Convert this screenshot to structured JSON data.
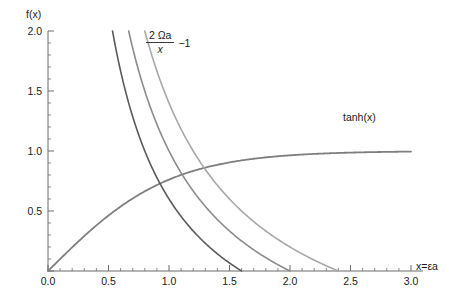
{
  "figure": {
    "background": "#ffffff",
    "axis_color": "#6b6b6b"
  },
  "axes": {
    "y_axis_title": "f(x)",
    "x_axis_title": "x=εa",
    "x_ticks": [
      "0.0",
      "0.5",
      "1.0",
      "1.5",
      "2.0",
      "2.5",
      "3.0"
    ],
    "y_ticks": [
      "0.5",
      "1.0",
      "1.5",
      "2.0"
    ]
  },
  "annotations": {
    "tanh_label": "tanh(x)",
    "formula_numerator": "2 Ωa",
    "formula_denominator": "x",
    "formula_tail": "−1"
  },
  "chart_data": {
    "type": "line",
    "title": "",
    "xlabel": "x=εa",
    "ylabel": "f(x)",
    "xlim": [
      0.0,
      3.0
    ],
    "ylim": [
      0.0,
      2.0
    ],
    "grid": false,
    "legend": "inline-annotations",
    "x_major_ticks": [
      0.0,
      0.5,
      1.0,
      1.5,
      2.0,
      2.5,
      3.0
    ],
    "y_major_ticks": [
      0.0,
      0.5,
      1.0,
      1.5,
      2.0
    ],
    "x_minor_tick_step": 0.1,
    "y_minor_tick_step": 0.1,
    "series": [
      {
        "name": "tanh(x)",
        "color": "#7f7f7f",
        "linewidth": 1.8,
        "formula": "tanh(x)",
        "x": [
          0.0,
          0.1,
          0.2,
          0.3,
          0.4,
          0.5,
          0.6,
          0.7,
          0.8,
          0.9,
          1.0,
          1.1,
          1.2,
          1.3,
          1.4,
          1.5,
          1.6,
          1.7,
          1.8,
          1.9,
          2.0,
          2.1,
          2.2,
          2.3,
          2.4,
          2.5,
          2.6,
          2.7,
          2.8,
          2.9,
          3.0
        ],
        "y": [
          0.0,
          0.1,
          0.197,
          0.291,
          0.38,
          0.462,
          0.537,
          0.604,
          0.664,
          0.716,
          0.762,
          0.8,
          0.834,
          0.862,
          0.885,
          0.905,
          0.922,
          0.935,
          0.947,
          0.956,
          0.964,
          0.97,
          0.976,
          0.98,
          0.984,
          0.987,
          0.989,
          0.991,
          0.993,
          0.994,
          0.995
        ],
        "label_position": {
          "x": 2.42,
          "y": 1.12
        }
      },
      {
        "name": "2Ωa/x − 1 (Ωa = 0.8)",
        "color": "#5a5a5a",
        "linewidth": 1.6,
        "omega_a": 0.8,
        "zero_crossing": 1.6,
        "x": [
          0.533,
          0.6,
          0.7,
          0.8,
          0.9,
          1.0,
          1.1,
          1.2,
          1.3,
          1.4,
          1.5,
          1.6
        ],
        "y": [
          2.0,
          1.667,
          1.286,
          1.0,
          0.778,
          0.6,
          0.455,
          0.333,
          0.231,
          0.143,
          0.067,
          0.0
        ]
      },
      {
        "name": "2Ωa/x − 1 (Ωa = 1.0)",
        "color": "#8c8c8c",
        "linewidth": 1.6,
        "omega_a": 1.0,
        "zero_crossing": 2.0,
        "x": [
          0.667,
          0.8,
          0.9,
          1.0,
          1.1,
          1.2,
          1.3,
          1.4,
          1.5,
          1.6,
          1.7,
          1.8,
          1.9,
          2.0
        ],
        "y": [
          2.0,
          1.5,
          1.222,
          1.0,
          0.818,
          0.667,
          0.538,
          0.429,
          0.333,
          0.25,
          0.176,
          0.111,
          0.053,
          0.0
        ]
      },
      {
        "name": "2Ωa/x − 1 (Ωa = 1.2)",
        "color": "#a8a8a8",
        "linewidth": 1.6,
        "omega_a": 1.2,
        "zero_crossing": 2.4,
        "x": [
          0.8,
          0.9,
          1.0,
          1.1,
          1.2,
          1.3,
          1.4,
          1.5,
          1.6,
          1.7,
          1.8,
          1.9,
          2.0,
          2.1,
          2.2,
          2.3,
          2.4
        ],
        "y": [
          2.0,
          1.667,
          1.4,
          1.182,
          1.0,
          0.846,
          0.714,
          0.6,
          0.5,
          0.412,
          0.333,
          0.263,
          0.2,
          0.143,
          0.091,
          0.043,
          0.0
        ]
      }
    ],
    "intersections": [
      {
        "series": "tanh(x) x 2Ωa/x-1 (Ωa=0.8)",
        "x": 0.93,
        "y": 0.73
      },
      {
        "series": "tanh(x) x 2Ωa/x-1 (Ωa=1.0)",
        "x": 1.2,
        "y": 0.83
      },
      {
        "series": "tanh(x) x 2Ωa/x-1 (Ωa=1.2)",
        "x": 1.45,
        "y": 0.9
      }
    ]
  }
}
